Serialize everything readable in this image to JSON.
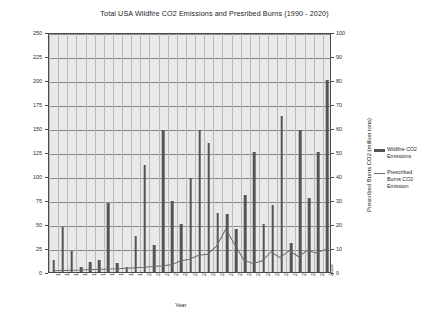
{
  "chart_data": {
    "type": "bar",
    "title": "Total USA Wildfire CO2 Emissions and Presribed Burns (1990 - 2020)",
    "xlabel": "Year",
    "ylabel": "Wildfire CO2 (million tons)",
    "ylabel_secondary": "Prescribed Burns CO2 (million tons)",
    "ylim": [
      0,
      250
    ],
    "ylim_secondary": [
      0,
      100
    ],
    "yticks": [
      0,
      25,
      50,
      75,
      100,
      125,
      150,
      175,
      200,
      225,
      250
    ],
    "yticks_secondary": [
      0,
      10,
      20,
      30,
      40,
      50,
      60,
      70,
      80,
      90,
      100
    ],
    "grid": true,
    "legend_position": "right",
    "categories": [
      "1990",
      "1991",
      "1992",
      "1993",
      "1994",
      "1995",
      "1996",
      "1997",
      "1998",
      "1999",
      "2000",
      "2001",
      "2002",
      "2003",
      "2004",
      "2005",
      "2006",
      "2007",
      "2008",
      "2009",
      "2010",
      "2011",
      "2012",
      "2013",
      "2014",
      "2015",
      "2016",
      "2017",
      "2018",
      "2019",
      "2020"
    ],
    "series": [
      {
        "name": "Wildfire CO2 Emissions",
        "type": "bar",
        "axis": "left",
        "color": "#555555",
        "values": [
          12,
          47,
          22,
          5,
          10,
          13,
          72,
          9,
          5,
          38,
          111,
          28,
          148,
          74,
          50,
          98,
          148,
          134,
          61,
          60,
          45,
          80,
          125,
          50,
          70,
          162,
          30,
          148,
          77,
          125,
          200
        ]
      },
      {
        "name": "Prescribed Burns CO2 Emission",
        "type": "line",
        "axis": "right",
        "color": "#6b6b6b",
        "values": [
          0.5,
          0.6,
          0.7,
          0.8,
          1.0,
          1.1,
          1.3,
          1.4,
          1.6,
          1.8,
          2.0,
          2.3,
          2.6,
          3.0,
          4.6,
          5.4,
          7.0,
          7.5,
          11.0,
          18.0,
          11.5,
          5.0,
          3.6,
          4.6,
          8.5,
          6.0,
          9.0,
          6.5,
          9.0,
          8.0,
          9.5
        ]
      }
    ]
  },
  "legend": {
    "items": [
      {
        "label_line1": "Wildfire CO2",
        "label_line2": "Emissions",
        "swatch": "bar"
      },
      {
        "label_line1": "Prescribed",
        "label_line2": "Burns CO2",
        "label_line3": "Emission",
        "swatch": "line"
      }
    ]
  }
}
